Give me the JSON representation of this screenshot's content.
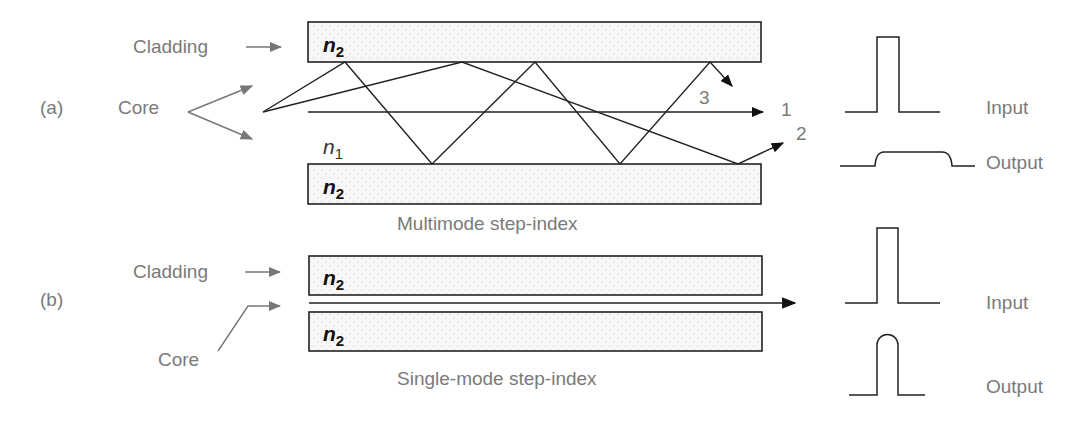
{
  "diagram": {
    "panel_a": {
      "tag": "(a)",
      "cladding_label": "Cladding",
      "core_label": "Core",
      "cladding_index_top": "n",
      "cladding_index_top_sub": "2",
      "core_index": "n",
      "core_index_sub": "1",
      "cladding_index_bottom": "n",
      "cladding_index_bottom_sub": "2",
      "caption": "Multimode step-index",
      "ray_labels": [
        "1",
        "2",
        "3"
      ],
      "pulse_input_label": "Input",
      "pulse_output_label": "Output"
    },
    "panel_b": {
      "tag": "(b)",
      "cladding_label": "Cladding",
      "core_label": "Core",
      "cladding_index_top": "n",
      "cladding_index_top_sub": "2",
      "cladding_index_bottom": "n",
      "cladding_index_bottom_sub": "2",
      "caption": "Single-mode step-index",
      "pulse_input_label": "Input",
      "pulse_output_label": "Output"
    },
    "colors": {
      "label_text": "#7a7a7a",
      "line": "#222222",
      "cladding_fill": "#f4f4f4",
      "leader_arrow": "#777777"
    }
  }
}
